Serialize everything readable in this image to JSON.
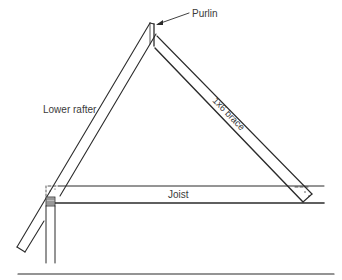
{
  "diagram": {
    "labels": {
      "purlin": "Purlin",
      "lower_rafter": "Lower rafter",
      "brace": "1x6 brace",
      "joist": "Joist"
    },
    "colors": {
      "line": "#2b2b2b",
      "text": "#3a3a3a",
      "background": "#ffffff"
    }
  }
}
